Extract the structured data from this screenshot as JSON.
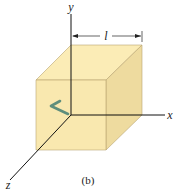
{
  "diagram": {
    "caption": "(b)",
    "axes": {
      "x_label": "x",
      "y_label": "y",
      "z_label": "z"
    },
    "dimension": {
      "label": "l"
    },
    "colors": {
      "front_face": "#f9e6a8",
      "top_face": "#fbecb6",
      "side_face": "#eedb9f",
      "edge": "#a89866",
      "axis": "#111111",
      "arrow": "#5e8e7c",
      "background": "#ffffff"
    }
  }
}
